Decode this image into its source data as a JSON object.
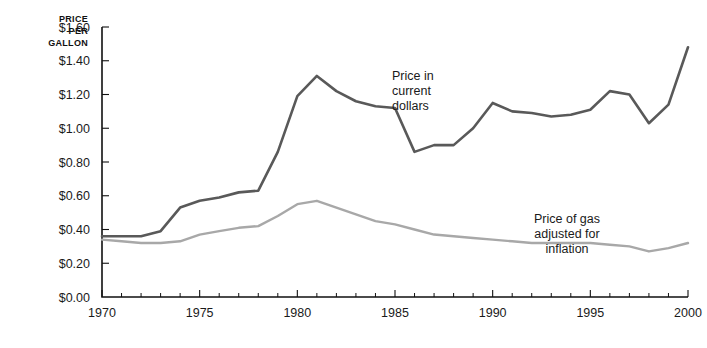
{
  "chart_data": {
    "type": "line",
    "title": "",
    "xlabel": "",
    "ylabel": "PRICE PER GALLON",
    "ylabel_lines": [
      "PRICE",
      "PER",
      "GALLON"
    ],
    "xlim": [
      1970,
      2000
    ],
    "ylim": [
      0.0,
      1.6
    ],
    "grid": false,
    "legend_position": "inline-annotations",
    "y_ticks": [
      0.0,
      0.2,
      0.4,
      0.6,
      0.8,
      1.0,
      1.2,
      1.4,
      1.6
    ],
    "y_tick_labels": [
      "$0.00",
      "$0.20",
      "$0.40",
      "$0.60",
      "$0.80",
      "$1.00",
      "$1.20",
      "$1.40",
      "$1.60"
    ],
    "x_ticks": [
      1970,
      1975,
      1980,
      1985,
      1990,
      1995,
      2000
    ],
    "x_tick_labels": [
      "1970",
      "1975",
      "1980",
      "1985",
      "1990",
      "1995",
      "2000"
    ],
    "x_minor_ticks": [
      1971,
      1972,
      1973,
      1974,
      1976,
      1977,
      1978,
      1979,
      1981,
      1982,
      1983,
      1984,
      1986,
      1987,
      1988,
      1989,
      1991,
      1992,
      1993,
      1994,
      1996,
      1997,
      1998,
      1999
    ],
    "x": [
      1970,
      1971,
      1972,
      1973,
      1974,
      1975,
      1976,
      1977,
      1978,
      1979,
      1980,
      1981,
      1982,
      1983,
      1984,
      1985,
      1986,
      1987,
      1988,
      1989,
      1990,
      1991,
      1992,
      1993,
      1994,
      1995,
      1996,
      1997,
      1998,
      1999,
      2000
    ],
    "series": [
      {
        "name": "Price in current dollars",
        "color": "#595959",
        "values": [
          0.36,
          0.36,
          0.36,
          0.39,
          0.53,
          0.57,
          0.59,
          0.62,
          0.63,
          0.86,
          1.19,
          1.31,
          1.22,
          1.16,
          1.13,
          1.12,
          0.86,
          0.9,
          0.9,
          1.0,
          1.15,
          1.1,
          1.09,
          1.07,
          1.08,
          1.11,
          1.22,
          1.2,
          1.03,
          1.14,
          1.48
        ]
      },
      {
        "name": "Price of gas adjusted for inflation",
        "color": "#a8a8a8",
        "values": [
          0.34,
          0.33,
          0.32,
          0.32,
          0.33,
          0.37,
          0.39,
          0.41,
          0.42,
          0.48,
          0.55,
          0.57,
          0.53,
          0.49,
          0.45,
          0.43,
          0.4,
          0.37,
          0.36,
          0.35,
          0.34,
          0.33,
          0.32,
          0.32,
          0.32,
          0.32,
          0.31,
          0.3,
          0.27,
          0.29,
          0.32
        ]
      }
    ],
    "annotations": [
      {
        "id": "annotation-current-dollars",
        "lines": [
          "Price in",
          "current",
          "dollars"
        ],
        "anchor_x": 392,
        "anchor_y": 80,
        "align": "start"
      },
      {
        "id": "annotation-adjusted-inflation",
        "lines": [
          "Price of gas",
          "adjusted for",
          "inflation"
        ],
        "anchor_x": 567,
        "anchor_y": 223,
        "align": "middle"
      }
    ]
  },
  "plot_geometry": {
    "left": 102,
    "right": 688,
    "top": 27,
    "bottom": 297
  }
}
